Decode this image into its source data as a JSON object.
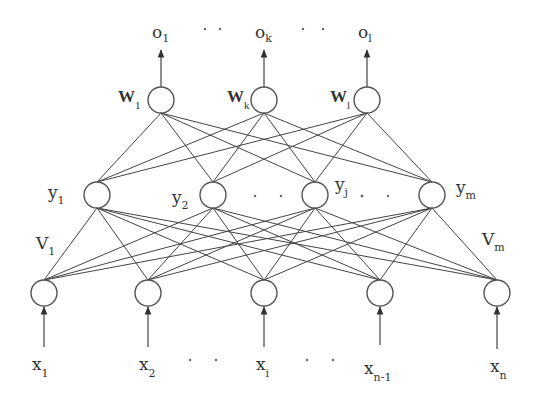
{
  "diagram": {
    "type": "three-layer-neural-network",
    "colors": {
      "line": "#444444",
      "node_stroke": "#555555",
      "text": "#333333",
      "background": "#ffffff"
    },
    "output_layer": {
      "nodes": [
        {
          "x": 161,
          "y": 100,
          "weight_label": "W",
          "weight_sub": "1",
          "output_label": "o",
          "output_sub": "1"
        },
        {
          "x": 264,
          "y": 100,
          "weight_label": "W",
          "weight_sub": "k",
          "output_label": "o",
          "output_sub": "k"
        },
        {
          "x": 367,
          "y": 100,
          "weight_label": "W",
          "weight_sub": "l",
          "output_label": "o",
          "output_sub": "l"
        }
      ],
      "ellipsis": "· ·"
    },
    "hidden_layer": {
      "nodes": [
        {
          "x": 97,
          "y": 195,
          "label": "y",
          "sub": "1"
        },
        {
          "x": 213,
          "y": 195,
          "label": "y",
          "sub": "2"
        },
        {
          "x": 315,
          "y": 195,
          "label": "y",
          "sub": "j"
        },
        {
          "x": 432,
          "y": 195,
          "label": "y",
          "sub": "m"
        }
      ],
      "ellipsis": "· ·"
    },
    "input_weights": [
      {
        "label": "V",
        "sub": "1"
      },
      {
        "label": "V",
        "sub": "m"
      }
    ],
    "input_layer": {
      "nodes": [
        {
          "x": 44,
          "y": 293,
          "label": "x",
          "sub": "1"
        },
        {
          "x": 148,
          "y": 293,
          "label": "x",
          "sub": "2"
        },
        {
          "x": 264,
          "y": 293,
          "label": "x",
          "sub": "i"
        },
        {
          "x": 380,
          "y": 293,
          "label": "x",
          "sub": "n-1"
        },
        {
          "x": 497,
          "y": 293,
          "label": "x",
          "sub": "n"
        }
      ],
      "ellipsis": "· ·"
    }
  },
  "labels": {
    "o1": "o",
    "o1_sub": "1",
    "ok": "o",
    "ok_sub": "k",
    "ol": "o",
    "ol_sub": "l",
    "w1": "W",
    "w1_sub": "1",
    "wk": "W",
    "wk_sub": "k",
    "wl": "W",
    "wl_sub": "l",
    "y1": "y",
    "y1_sub": "1",
    "y2": "y",
    "y2_sub": "2",
    "yj": "y",
    "yj_sub": "j",
    "ym": "y",
    "ym_sub": "m",
    "v1": "V",
    "v1_sub": "1",
    "vm": "V",
    "vm_sub": "m",
    "x1": "x",
    "x1_sub": "1",
    "x2": "x",
    "x2_sub": "2",
    "xi": "x",
    "xi_sub": "i",
    "xn1": "x",
    "xn1_sub": "n-1",
    "xn": "x",
    "xn_sub": "n"
  }
}
